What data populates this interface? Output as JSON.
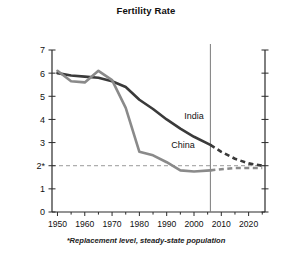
{
  "chart_data": {
    "type": "line",
    "title": "Fertility Rate",
    "xlabel": "",
    "ylabel": "Children per woman",
    "xlim": [
      1948,
      2026
    ],
    "ylim": [
      0,
      7
    ],
    "grid": false,
    "legend_position": "inline-labels",
    "y_ticks": [
      0,
      1,
      2,
      3,
      4,
      5,
      6,
      7
    ],
    "y_tick_labels": [
      "0",
      "1",
      "2*",
      "3",
      "4",
      "5",
      "6",
      "7"
    ],
    "x_ticks": [
      1950,
      1955,
      1960,
      1965,
      1970,
      1975,
      1980,
      1985,
      1990,
      1995,
      2000,
      2005,
      2010,
      2015,
      2020,
      2025
    ],
    "x_tick_labels": [
      "1950",
      "1960",
      "1970",
      "1980",
      "1990",
      "2000",
      "2010",
      "2020"
    ],
    "x_major_ticks": [
      1950,
      1960,
      1970,
      1980,
      1990,
      2000,
      2010,
      2020
    ],
    "annotations": [
      {
        "text": "*Replacement level, steady-state population",
        "kind": "footnote"
      },
      {
        "text": "2*",
        "kind": "replacement-level-tick",
        "value": 2.0
      }
    ],
    "reference_lines": [
      {
        "name": "replacement-level",
        "orientation": "horizontal",
        "value": 2.0,
        "style": "dashed",
        "color": "#9a9a9a"
      },
      {
        "name": "projection-divider",
        "orientation": "vertical",
        "value": 2006,
        "style": "solid",
        "color": "#7a7a7a"
      }
    ],
    "series": [
      {
        "name": "India",
        "label": "India",
        "color": "#3a3a3a",
        "x": [
          1950,
          1955,
          1960,
          1965,
          1970,
          1975,
          1980,
          1985,
          1990,
          1995,
          2000,
          2006
        ],
        "values": [
          6.0,
          5.9,
          5.85,
          5.8,
          5.65,
          5.4,
          4.85,
          4.45,
          4.0,
          3.6,
          3.25,
          2.9
        ],
        "projection_x": [
          2006,
          2010,
          2015,
          2020,
          2025
        ],
        "projection_values": [
          2.9,
          2.6,
          2.3,
          2.1,
          2.0
        ],
        "label_position": {
          "x": 2000,
          "y": 4.0
        }
      },
      {
        "name": "China",
        "label": "China",
        "color": "#8a8a8a",
        "x": [
          1950,
          1955,
          1960,
          1965,
          1970,
          1975,
          1980,
          1985,
          1990,
          1995,
          2000,
          2006
        ],
        "values": [
          6.1,
          5.65,
          5.6,
          6.1,
          5.7,
          4.5,
          2.6,
          2.45,
          2.15,
          1.8,
          1.75,
          1.8
        ],
        "projection_x": [
          2006,
          2010,
          2015,
          2020,
          2025
        ],
        "projection_values": [
          1.8,
          1.85,
          1.9,
          1.9,
          1.9
        ],
        "label_position": {
          "x": 1996,
          "y": 2.75
        }
      }
    ]
  },
  "chart": {
    "title": "Fertility Rate",
    "y_axis_title": "Children per woman",
    "footnote": "*Replacement level, steady-state population"
  }
}
